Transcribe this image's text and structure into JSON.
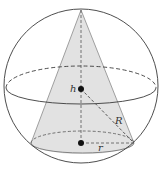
{
  "diagram": {
    "labels": {
      "height": "h",
      "sphere_radius": "R",
      "cone_base_radius": "r"
    },
    "colors": {
      "stroke": "#3a3a3a",
      "cone_fill": "#e2e2e2",
      "point": "#111111",
      "background": "#ffffff"
    }
  }
}
